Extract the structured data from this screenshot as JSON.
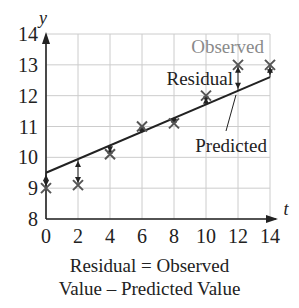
{
  "chart_data": {
    "type": "scatter",
    "title": "",
    "xlabel": "t",
    "ylabel": "y",
    "xlim": [
      0,
      14
    ],
    "ylim": [
      8,
      14
    ],
    "x_ticks": [
      "0",
      "2",
      "4",
      "6",
      "8",
      "10",
      "12",
      "14"
    ],
    "y_ticks": [
      "8",
      "9",
      "10",
      "11",
      "12",
      "13",
      "14"
    ],
    "grid": true,
    "series": [
      {
        "name": "Observed",
        "marker": "x",
        "x": [
          0,
          2,
          4,
          6,
          8,
          10,
          12,
          14
        ],
        "y": [
          9.0,
          9.1,
          10.1,
          11.0,
          11.1,
          12.0,
          13.0,
          13.0
        ]
      },
      {
        "name": "Predicted",
        "type": "line",
        "x": [
          0,
          14
        ],
        "y": [
          9.5,
          12.6
        ]
      }
    ],
    "annotations": [
      {
        "text": "Observed",
        "color": "#888888"
      },
      {
        "text": "Residual",
        "color": "#222222"
      },
      {
        "text": "Predicted",
        "color": "#222222"
      }
    ]
  },
  "caption": {
    "line1": "Residual = Observed",
    "line2": "Value – Predicted Value"
  },
  "colors": {
    "axis": "#222222",
    "grid": "#cccccc",
    "observed_label": "#8a8a8a",
    "marker": "#555555"
  }
}
